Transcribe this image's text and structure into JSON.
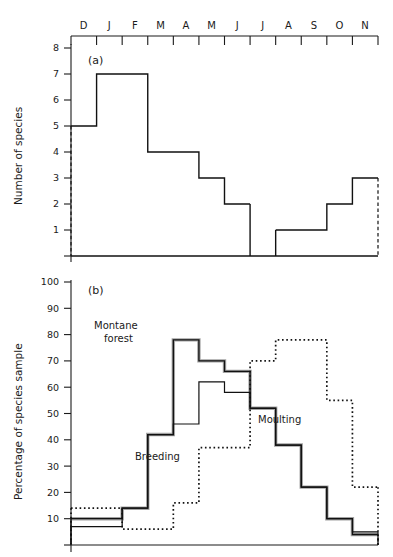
{
  "figure": {
    "months": [
      "D",
      "J",
      "F",
      "M",
      "A",
      "M",
      "J",
      "J",
      "A",
      "S",
      "O",
      "N"
    ],
    "panel_a_label": "(a)",
    "panel_b_label": "(b)",
    "panel_a_ytitle": "Number of species",
    "panel_b_ytitle": "Percentage of species sample",
    "annotations": {
      "montane_line1": "Montane",
      "montane_line2": "forest",
      "breeding": "Breeding",
      "moulting": "Moulting"
    },
    "panel_a_yticks": [
      "8",
      "7",
      "6",
      "5",
      "4",
      "3",
      "2",
      "1"
    ],
    "panel_b_yticks": [
      "100",
      "90",
      "80",
      "70",
      "60",
      "50",
      "40",
      "30",
      "20",
      "10"
    ]
  },
  "chart_data": [
    {
      "type": "bar",
      "panel": "(a)",
      "title": "",
      "xlabel": "",
      "ylabel": "Number of species",
      "categories": [
        "D",
        "J",
        "F",
        "M",
        "A",
        "M",
        "J",
        "J",
        "A",
        "S",
        "O",
        "N"
      ],
      "values": [
        5,
        7,
        7,
        4,
        4,
        3,
        2,
        0,
        1,
        1,
        2,
        3
      ],
      "ylim": [
        0,
        8
      ],
      "xlim_note": "month bins D through N, step histogram with open (dashed) ends",
      "grid": false,
      "legend": "none",
      "style": "step-histogram-solid-with-dashed-open-ends"
    },
    {
      "type": "line",
      "panel": "(b)",
      "title": "",
      "xlabel": "",
      "ylabel": "Percentage of species sample",
      "categories": [
        "D",
        "J",
        "F",
        "M",
        "A",
        "M",
        "J",
        "J",
        "A",
        "S",
        "O",
        "N"
      ],
      "ylim": [
        0,
        100
      ],
      "grid": false,
      "legend": "in-plot text annotations",
      "style": "step-histogram",
      "series": [
        {
          "name": "Montane forest",
          "style": "hatched",
          "values": [
            10,
            10,
            14,
            42,
            78,
            70,
            66,
            52,
            38,
            22,
            10,
            4
          ]
        },
        {
          "name": "Breeding",
          "style": "solid",
          "values": [
            7,
            7,
            14,
            42,
            46,
            62,
            58,
            52,
            38,
            22,
            10,
            5
          ]
        },
        {
          "name": "Moulting",
          "style": "dotted",
          "values": [
            14,
            14,
            6,
            6,
            16,
            37,
            37,
            70,
            78,
            78,
            55,
            22
          ]
        }
      ]
    }
  ]
}
